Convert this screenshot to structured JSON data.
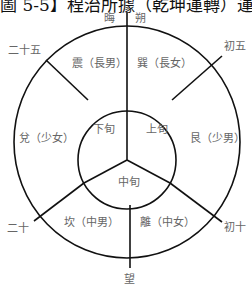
{
  "title": "圖 5-5】程治所據（乾坤運轉）運行規律",
  "diagram": {
    "type": "circular-phase-diagram",
    "colors": {
      "line": "#111111",
      "text": "#666666",
      "background": "#ffffff"
    },
    "day_markers": {
      "hui": "晦",
      "shuo": "朔",
      "chu_wu": "初五",
      "chu_shi": "初十",
      "wang": "望",
      "er_shi": "二十",
      "er_shi_wu": "二十五"
    },
    "trigrams": {
      "zhen": "震（長男）",
      "xun": "巽（長女）",
      "gen": "艮（少男）",
      "li": "離（中女）",
      "kan": "坎（中男）",
      "dui": "兌（少女）"
    },
    "inner": {
      "shang_xun": "上旬",
      "xia_xun": "下旬",
      "zhong_xun": "中旬"
    }
  }
}
